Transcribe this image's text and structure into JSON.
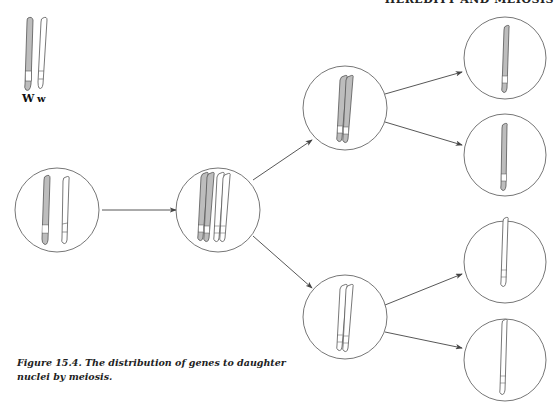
{
  "header": {
    "running_title": "HEREDITY AND MEIOSIS"
  },
  "legend": {
    "dominant_allele_label": "W",
    "recessive_allele_label": "w"
  },
  "caption": {
    "text": "Figure 15.4. The distribution of genes to daughter nuclei by meiosis."
  },
  "diagram": {
    "title": "Distribution of genes to daughter nuclei by meiosis",
    "colors": {
      "shaded_chromosome": "#bdbdbd",
      "outline": "#555555",
      "circle": "#666666",
      "arrow": "#444444",
      "band": "#ffffff"
    },
    "stages": [
      {
        "id": "parent-cell",
        "description": "Homologous pair W (shaded) and w (unshaded)"
      },
      {
        "id": "tetrad-cell",
        "description": "Replicated homologs paired as tetrad"
      },
      {
        "id": "dyad-W",
        "description": "Two W chromatids (shaded)"
      },
      {
        "id": "dyad-w",
        "description": "Two w chromatids (unshaded)"
      },
      {
        "id": "gamete-1",
        "allele": "W"
      },
      {
        "id": "gamete-2",
        "allele": "W"
      },
      {
        "id": "gamete-3",
        "allele": "w"
      },
      {
        "id": "gamete-4",
        "allele": "w"
      }
    ]
  }
}
